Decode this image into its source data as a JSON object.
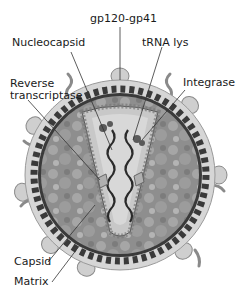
{
  "labels": {
    "gp120": "gp120-gp41",
    "nucleocapsid": "Nucleocapsid",
    "trna": "tRNA lys",
    "reverse_line1": "Reverse",
    "reverse_line2": "transcriptase",
    "integrase": "Integrase",
    "capsid": "Capsid",
    "matrix": "Matrix"
  },
  "colors": {
    "envelope": "#d6d6d6",
    "envelope_edge": "#9a9a9a",
    "matrix": "#3a3a3a",
    "interior": "#8c8c8c",
    "interior_light": "#b0b0b0",
    "capsid": "#c8c8c8",
    "rna": "#2a2a2a",
    "spike": "#cfcfcf",
    "leader": "#333333"
  }
}
